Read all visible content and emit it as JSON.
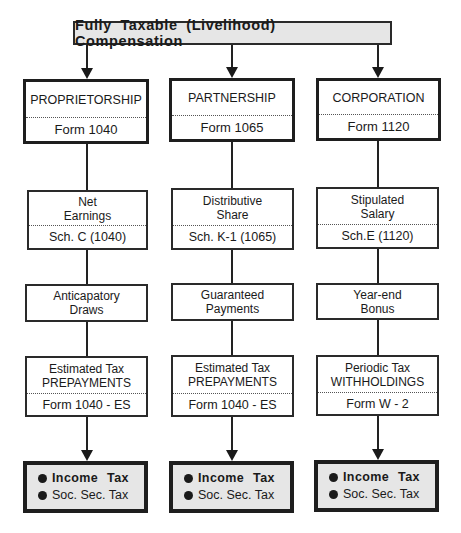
{
  "title": "Fully Taxable (Livelihood) Compensation",
  "columns": [
    {
      "entity": "PROPRIETORSHIP",
      "entity_form": "Form 1040",
      "income_label": "Net Earnings",
      "income_line1": "Net",
      "income_line2": "Earnings",
      "income_schedule": "Sch. C  (1040)",
      "payment_line1": "Anticapatory",
      "payment_line2": "Draws",
      "tax_line1": "Estimated Tax",
      "tax_line2": "PREPAYMENTS",
      "tax_form": "Form 1040 - ES",
      "result_items": [
        "Income  Tax",
        "Soc. Sec. Tax"
      ]
    },
    {
      "entity": "PARTNERSHIP",
      "entity_form": "Form 1065",
      "income_line1": "Distributive",
      "income_line2": "Share",
      "income_schedule": "Sch. K-1  (1065)",
      "payment_line1": "Guaranteed",
      "payment_line2": "Payments",
      "tax_line1": "Estimated Tax",
      "tax_line2": "PREPAYMENTS",
      "tax_form": "Form 1040 - ES",
      "result_items": [
        "Income  Tax",
        "Soc. Sec. Tax"
      ]
    },
    {
      "entity": "CORPORATION",
      "entity_form": "Form 1120",
      "income_line1": "Stipulated",
      "income_line2": "Salary",
      "income_schedule": "Sch.E  (1120)",
      "payment_line1": "Year-end",
      "payment_line2": "Bonus",
      "tax_line1": "Periodic Tax",
      "tax_line2": "WITHHOLDINGS",
      "tax_form": "Form W - 2",
      "result_items": [
        "Income  Tax",
        "Soc. Sec. Tax"
      ]
    }
  ],
  "colors": {
    "line": "#1a1a1a",
    "shaded_fill": "#e6e6e6",
    "box_fill": "#ffffff"
  }
}
